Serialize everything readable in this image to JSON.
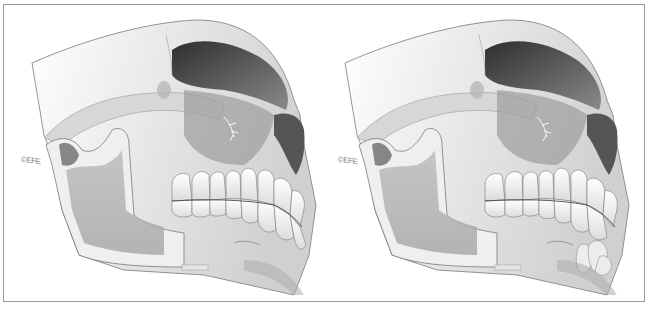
{
  "figure": {
    "panels": [
      {
        "id": "left",
        "description": "Lateral view of skull with mandible, normal chin region",
        "copyright": "©EFE"
      },
      {
        "id": "right",
        "description": "Lateral view of skull with mandible, with lobulated growth at chin/anterior mandible",
        "copyright": "©EFE"
      }
    ],
    "colors": {
      "frame": "#9a9a9a",
      "bone_light": "#f2f2f2",
      "bone_mid": "#c8c8c8",
      "bone_shadow": "#6e6e6e",
      "orbit_dark": "#3e3e3e",
      "ramus_shade": "#b4b4b4"
    }
  }
}
